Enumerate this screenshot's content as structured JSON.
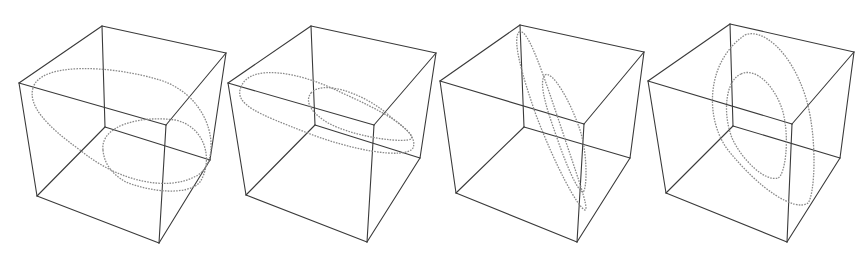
{
  "figure": {
    "colors": {
      "background": "#ffffff",
      "cube_edge": "#3a3a3a",
      "curve": "#8a8a8a"
    },
    "panels": [
      {
        "id": 1,
        "cube": {
          "tb": [
            102,
            26
          ],
          "lt": [
            19,
            83
          ],
          "tr": [
            226,
            53
          ],
          "ft": [
            166,
            125
          ],
          "bl": [
            37,
            196
          ],
          "bf": [
            159,
            243
          ],
          "rb": [
            210,
            160
          ],
          "bb": [
            105,
            127
          ]
        },
        "curves": [
          "M33,88 C40,62 110,65 160,80 C215,98 222,160 198,175 C170,192 120,183 80,150 C45,125 28,105 33,88 Z",
          "M103,150 C100,126 140,115 175,120 C205,126 214,160 200,182 C188,196 150,192 126,182 C110,173 104,162 103,150 Z"
        ]
      },
      {
        "id": 2,
        "cube": {
          "tb": [
            311,
            26
          ],
          "lt": [
            228,
            83
          ],
          "tr": [
            436,
            53
          ],
          "ft": [
            374,
            125
          ],
          "bl": [
            246,
            195
          ],
          "bf": [
            367,
            242
          ],
          "rb": [
            420,
            158
          ],
          "bb": [
            315,
            125
          ]
        },
        "curves": [
          "M241,87 C250,63 300,72 340,92 C380,110 420,130 413,148 C405,160 350,150 305,132 C262,115 233,105 241,87 Z",
          "M311,93 C322,80 360,92 385,112 C400,125 420,138 408,140 C390,142 352,135 330,124 C312,114 304,102 311,93 Z"
        ]
      },
      {
        "id": 3,
        "cube": {
          "tb": [
            520,
            25
          ],
          "lt": [
            440,
            81
          ],
          "tr": [
            644,
            52
          ],
          "ft": [
            584,
            124
          ],
          "bl": [
            456,
            193
          ],
          "bf": [
            577,
            242
          ],
          "rb": [
            630,
            158
          ],
          "bb": [
            524,
            127
          ]
        },
        "curves": [
          "M519,32 C528,26 545,80 562,130 C575,170 590,210 585,210 C578,208 555,165 536,115 C522,75 512,40 519,32 Z",
          "M545,75 C552,70 570,100 580,130 C588,155 587,190 583,192 C578,192 566,165 556,135 C547,110 538,82 545,75 Z"
        ]
      },
      {
        "id": 4,
        "cube": {
          "tb": [
            730,
            24
          ],
          "lt": [
            648,
            81
          ],
          "tr": [
            854,
            52
          ],
          "ft": [
            792,
            124
          ],
          "bl": [
            666,
            193
          ],
          "bf": [
            787,
            242
          ],
          "rb": [
            840,
            158
          ],
          "bb": [
            733,
            126
          ]
        },
        "curves": [
          "M745,35 C762,28 790,50 805,95 C818,135 815,195 808,203 C795,212 760,190 728,150 C705,120 705,62 745,35 Z",
          "M741,74 C755,67 775,85 783,112 C790,140 785,175 778,178 C765,182 742,160 732,138 C722,112 726,80 741,74 Z"
        ]
      }
    ]
  }
}
